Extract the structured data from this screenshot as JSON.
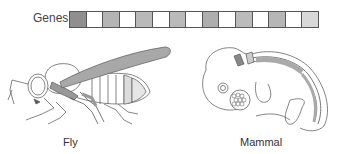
{
  "genes": {
    "label": "Genes",
    "cells": [
      {
        "color": "#8f8f8f"
      },
      {
        "color": "#ffffff"
      },
      {
        "color": "#b4b4b4"
      },
      {
        "color": "#ffffff"
      },
      {
        "color": "#b9b9b9"
      },
      {
        "color": "#ffffff"
      },
      {
        "color": "#bababa"
      },
      {
        "color": "#ffffff"
      },
      {
        "color": "#aeaeae"
      },
      {
        "color": "#ffffff"
      },
      {
        "color": "#bbbbbb"
      },
      {
        "color": "#ffffff"
      },
      {
        "color": "#b6b6b6"
      },
      {
        "color": "#ffffff"
      },
      {
        "color": "#d8d8d8"
      }
    ]
  },
  "organisms": {
    "fly": {
      "label": "Fly"
    },
    "mammal": {
      "label": "Mammal"
    }
  }
}
